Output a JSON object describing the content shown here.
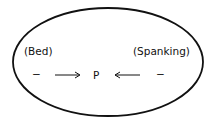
{
  "diagram": {
    "shape": "ellipse",
    "left_label": "(Bed)",
    "right_label": "(Spanking)",
    "left_valence": "−",
    "right_valence": "−",
    "center_label": "P",
    "left_arrow": "→ toward P",
    "right_arrow": "← toward P",
    "colors": {
      "stroke": "#111111",
      "background": "#ffffff"
    }
  }
}
